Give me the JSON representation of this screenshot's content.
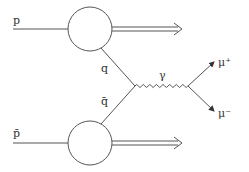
{
  "diagram": {
    "type": "feynman",
    "title": "",
    "labels": {
      "proton": "p",
      "antiproton": "p̄",
      "quark": "q",
      "antiquark": "q̄",
      "photon": "γ",
      "muon_plus": "μ⁺",
      "muon_minus": "μ⁻"
    },
    "colors": {
      "line": "#555555",
      "text": "#333333"
    }
  }
}
